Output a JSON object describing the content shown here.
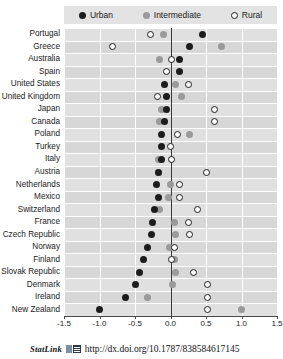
{
  "legend": {
    "items": [
      {
        "label": "Urban",
        "marker": "filled-dark-circle-icon",
        "color": "#1c1c1c"
      },
      {
        "label": "Intermediate",
        "marker": "filled-gray-circle-icon",
        "color": "#9a9a9a"
      },
      {
        "label": "Rural",
        "marker": "open-circle-icon",
        "color": "#ffffff"
      }
    ]
  },
  "footer": {
    "statlink_label": "StatLink",
    "statlink_icon": "spreadsheet-icon",
    "url": "http://dx.doi.org/10.1787/838584617145"
  },
  "chart_data": {
    "type": "scatter",
    "title": "",
    "subtitle": "",
    "xlabel": "",
    "ylabel": "",
    "xlim": [
      -1.5,
      1.5
    ],
    "xticks": [
      "-1.5",
      "-1.0",
      "-0.5",
      "0.0",
      "0.5",
      "1.0",
      "1.5"
    ],
    "xtick_values": [
      -1.5,
      -1.0,
      -0.5,
      0.0,
      0.5,
      1.0,
      1.5
    ],
    "grid": "vertical-and-horizontal-white-on-gray",
    "zero_reference_line": 0.0,
    "legend_position": "top",
    "orientation": "horizontal",
    "categories": [
      "Portugal",
      "Greece",
      "Australia",
      "Spain",
      "United States",
      "United Kingdom",
      "Japan",
      "Canada",
      "Poland",
      "Turkey",
      "Italy",
      "Austria",
      "Netherlands",
      "Mexico",
      "Switzerland",
      "France",
      "Czech Republic",
      "Norway",
      "Finland",
      "Slovak Republic",
      "Denmark",
      "Ireland",
      "New Zealand"
    ],
    "series": [
      {
        "name": "Urban",
        "color": "#1c1c1c",
        "values": [
          0.45,
          0.27,
          0.12,
          0.13,
          -0.08,
          -0.06,
          -0.06,
          -0.08,
          -0.12,
          -0.13,
          -0.13,
          -0.17,
          -0.2,
          -0.17,
          -0.22,
          -0.25,
          -0.27,
          -0.33,
          -0.38,
          -0.44,
          -0.5,
          -0.63,
          -1.0
        ]
      },
      {
        "name": "Intermediate",
        "color": "#9a9a9a",
        "values": [
          -0.1,
          0.72,
          -0.15,
          null,
          0.07,
          0.16,
          -0.13,
          -0.16,
          0.27,
          null,
          -0.17,
          -0.17,
          0.0,
          -0.03,
          -0.15,
          0.05,
          0.07,
          -0.02,
          0.05,
          0.07,
          0.03,
          -0.33,
          1.0
        ]
      },
      {
        "name": "Rural",
        "color": "#ffffff",
        "values": [
          -0.28,
          -0.82,
          0.02,
          -0.06,
          0.25,
          -0.18,
          0.62,
          0.62,
          0.1,
          0.0,
          0.02,
          0.5,
          0.12,
          0.13,
          0.38,
          0.25,
          0.27,
          0.05,
          0.02,
          0.33,
          0.52,
          0.52,
          0.52
        ]
      }
    ]
  }
}
